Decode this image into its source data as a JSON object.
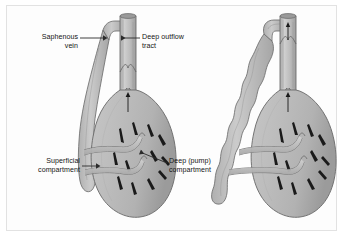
{
  "figure": {
    "background_color": "#ffffff",
    "frame_color": "#e2e2e2",
    "vessel_fill": "#b9b9b9",
    "vessel_fill_light": "#c9c9c9",
    "vessel_outline": "#6e6e6e",
    "muscle_fiber_color": "#1a1a1a",
    "label_color": "#151515",
    "leader_color": "#2b2b2b"
  },
  "labels": {
    "saphenous_vein": {
      "line1": "Saphenous",
      "line2": "vein",
      "align": "right",
      "arrow": "right"
    },
    "deep_outflow_tract": {
      "line1": "Deep outflow",
      "line2": "tract",
      "align": "left",
      "arrow": "left"
    },
    "superficial_compartment": {
      "line1": "Superficial",
      "line2": "compartment",
      "align": "right",
      "arrow": "right"
    },
    "deep_pump_compartment": {
      "line1": "Deep (pump)",
      "line2": "compartment",
      "align": "left",
      "arrow": "left"
    }
  },
  "panels": [
    {
      "name": "normal-limb",
      "saphenous_state": "normal",
      "description": "Straight saphenous vein joining deep outflow tract, two perforating veins"
    },
    {
      "name": "varicose-limb",
      "saphenous_state": "varicose",
      "description": "Tortuous dilated saphenous vein joining deep outflow tract, two perforating veins"
    }
  ]
}
